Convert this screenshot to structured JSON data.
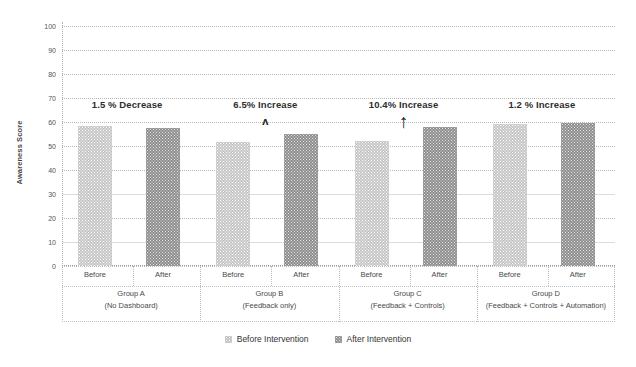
{
  "chart_data": {
    "type": "bar",
    "title": "",
    "xlabel": "",
    "ylabel": "Awareness Score",
    "ylim": [
      0,
      100
    ],
    "yticks": [
      0,
      10,
      20,
      30,
      40,
      50,
      60,
      70,
      80,
      90,
      100
    ],
    "grid": true,
    "legend_position": "bottom-center",
    "categories": [
      "Group A (No Dashboard)",
      "Group B (Feedback only)",
      "Group C (Feedback + Controls)",
      "Group D (Feedback + Controls + Automation)"
    ],
    "sub_categories": [
      "Before",
      "After"
    ],
    "series": [
      {
        "name": "Before Intervention",
        "values": [
          58.5,
          51.5,
          52.0,
          59.0
        ]
      },
      {
        "name": "After Intervention",
        "values": [
          57.5,
          55.0,
          58.0,
          59.5
        ]
      }
    ],
    "annotations": [
      {
        "text": "1.5 % Decrease",
        "group": 0,
        "marker": "none"
      },
      {
        "text": "6.5% Increase",
        "group": 1,
        "marker": "caret-up"
      },
      {
        "text": "10.4% Increase",
        "group": 2,
        "marker": "arrow-up"
      },
      {
        "text": "1.2 % Increase",
        "group": 3,
        "marker": "none"
      }
    ]
  },
  "axis": {
    "y_title": "Awareness Score",
    "ticks": [
      "100",
      "90",
      "80",
      "70",
      "60",
      "50",
      "40",
      "30",
      "20",
      "10",
      "0"
    ]
  },
  "groups": [
    {
      "tick_before": "Before",
      "tick_after": "After",
      "name": "Group A",
      "detail": "(No Dashboard)"
    },
    {
      "tick_before": "Before",
      "tick_after": "After",
      "name": "Group B",
      "detail": "(Feedback only)"
    },
    {
      "tick_before": "Before",
      "tick_after": "After",
      "name": "Group C",
      "detail": "(Feedback + Controls)"
    },
    {
      "tick_before": "Before",
      "tick_after": "After",
      "name": "Group D",
      "detail": "(Feedback + Controls + Automation)"
    }
  ],
  "annotations": [
    {
      "label": "1.5 % Decrease"
    },
    {
      "label": "6.5% Increase"
    },
    {
      "label": "10.4% Increase"
    },
    {
      "label": "1.2 % Increase"
    }
  ],
  "markers": {
    "caret": "ʌ",
    "arrow_up": "↑"
  },
  "legend": {
    "before": "Before Intervention",
    "after": "After Intervention"
  },
  "colors": {
    "before_bar": "#c6c6c6",
    "after_bar": "#8e8e8e",
    "grid": "#b9b9b9",
    "text": "#3d3d3d",
    "background": "#ffffff"
  }
}
